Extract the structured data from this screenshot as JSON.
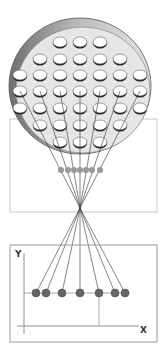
{
  "diagram": {
    "title": "",
    "colors": {
      "disk_fill": "#e6e6e6",
      "disk_rim": "#8a8a8a",
      "disk_rim_light": "#d8d8d8",
      "hole_fill": "#ffffff",
      "hole_stroke": "#222222",
      "line": "#333333",
      "frame": "#c8c8c8",
      "frame_dark": "#9a9a9a",
      "dot": "#666666",
      "dot_small": "#9a9a9a"
    },
    "disk": {
      "cx": 80,
      "cy": 86,
      "rx": 71,
      "ry": 68,
      "hole_rows": [
        {
          "y": 42,
          "xs": [
            60,
            80,
            100
          ]
        },
        {
          "y": 59,
          "xs": [
            40,
            60,
            80,
            100,
            120
          ]
        },
        {
          "y": 75,
          "xs": [
            20,
            40,
            60,
            80,
            100,
            120,
            140
          ]
        },
        {
          "y": 91,
          "xs": [
            20,
            40,
            60,
            80,
            100,
            120,
            140
          ]
        },
        {
          "y": 108,
          "xs": [
            20,
            40,
            60,
            80,
            100,
            120,
            140
          ]
        },
        {
          "y": 125,
          "xs": [
            40,
            60,
            80,
            100,
            120
          ]
        },
        {
          "y": 142,
          "xs": [
            60,
            80,
            100
          ]
        }
      ]
    },
    "middle_frame": {
      "x": 10,
      "y": 119,
      "w": 147,
      "h": 93
    },
    "focus_point": {
      "x": 80,
      "y": 208
    },
    "source_points": [
      [
        20,
        91
      ],
      [
        40,
        91
      ],
      [
        60,
        91
      ],
      [
        80,
        91
      ],
      [
        100,
        91
      ],
      [
        120,
        91
      ],
      [
        140,
        91
      ]
    ],
    "middle_dots": {
      "y": 170,
      "xs": [
        61,
        68,
        74,
        80,
        86,
        92,
        100
      ]
    },
    "plot": {
      "frame": {
        "x": 10,
        "y": 245,
        "w": 147,
        "h": 97
      },
      "y_axis": {
        "x": 24,
        "y1": 253,
        "y2": 334
      },
      "x_axis": {
        "y": 326,
        "x1": 17,
        "x2": 139
      },
      "y_label": "Y",
      "x_label": "X",
      "level_line": {
        "y": 293,
        "x1": 24,
        "x2": 130
      },
      "drop_line": {
        "x": 99,
        "y1": 293,
        "y2": 326
      },
      "points": [
        36,
        46,
        62,
        80,
        99,
        115,
        125
      ]
    }
  }
}
